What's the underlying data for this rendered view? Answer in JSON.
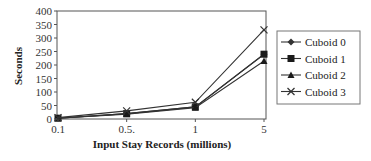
{
  "chart_data": {
    "type": "line",
    "title": "",
    "xlabel": "Input Stay Records (millions)",
    "ylabel": "Seconds",
    "categories": [
      "0.1",
      "0.5.",
      "1",
      "5"
    ],
    "ylim": [
      0,
      400
    ],
    "yticks": [
      0,
      50,
      100,
      150,
      200,
      250,
      300,
      350,
      400
    ],
    "grid": false,
    "legend_position": "right",
    "series": [
      {
        "name": "Cuboid 0",
        "marker": "diamond",
        "values": [
          3,
          20,
          45,
          240
        ]
      },
      {
        "name": "Cuboid 1",
        "marker": "square",
        "values": [
          3,
          20,
          45,
          240
        ]
      },
      {
        "name": "Cuboid 2",
        "marker": "triangle",
        "values": [
          3,
          18,
          42,
          215
        ]
      },
      {
        "name": "Cuboid 3",
        "marker": "x",
        "values": [
          5,
          30,
          62,
          330
        ]
      }
    ]
  },
  "colors": {
    "line": "#333333",
    "axis": "#555555"
  }
}
